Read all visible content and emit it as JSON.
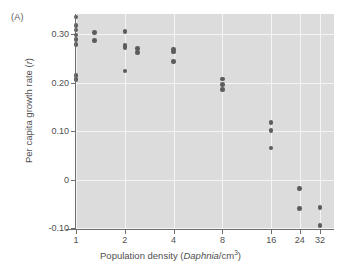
{
  "panel": {
    "label": "(A)"
  },
  "chart_data": {
    "type": "scatter",
    "title": "",
    "xlabel_parts": {
      "pre": "Population density (",
      "italic": "Daphnia",
      "post": "/cm",
      "sup": "3",
      "end": ")"
    },
    "xlabel": "Population density (Daphnia/cm3)",
    "ylabel_parts": {
      "pre": "Per capita growth rate (",
      "italic": "r",
      "post": ")"
    },
    "ylabel": "Per capita growth rate (r)",
    "x_scale": "log",
    "x_ticks": [
      1,
      2,
      4,
      8,
      16,
      24,
      32
    ],
    "x_tick_labels": [
      "1",
      "2",
      "4",
      "8",
      "16",
      "24",
      "32"
    ],
    "y_ticks": [
      0.3,
      0.2,
      0.1,
      0,
      -0.1
    ],
    "y_tick_labels": [
      "0.30",
      "0.20",
      "0.10",
      "0",
      "-0.10"
    ],
    "ylim": [
      -0.105,
      0.345
    ],
    "grid": true,
    "grid_color": "#f4f4f4",
    "plot_background": "#dcdcdc",
    "point_color": "#5c5c5c",
    "legend": null,
    "points": [
      {
        "x": 1,
        "y": 0.335
      },
      {
        "x": 1,
        "y": 0.317
      },
      {
        "x": 1,
        "y": 0.308
      },
      {
        "x": 1,
        "y": 0.298
      },
      {
        "x": 1,
        "y": 0.289
      },
      {
        "x": 1,
        "y": 0.278
      },
      {
        "x": 1,
        "y": 0.214
      },
      {
        "x": 1,
        "y": 0.206
      },
      {
        "x": 1.3,
        "y": 0.303
      },
      {
        "x": 1.3,
        "y": 0.287
      },
      {
        "x": 2,
        "y": 0.305
      },
      {
        "x": 2,
        "y": 0.276
      },
      {
        "x": 2,
        "y": 0.272
      },
      {
        "x": 2,
        "y": 0.224
      },
      {
        "x": 2.4,
        "y": 0.27
      },
      {
        "x": 2.4,
        "y": 0.262
      },
      {
        "x": 4,
        "y": 0.268
      },
      {
        "x": 4,
        "y": 0.263
      },
      {
        "x": 4,
        "y": 0.243
      },
      {
        "x": 8,
        "y": 0.207
      },
      {
        "x": 8,
        "y": 0.196
      },
      {
        "x": 8,
        "y": 0.186
      },
      {
        "x": 16,
        "y": 0.118
      },
      {
        "x": 16,
        "y": 0.101
      },
      {
        "x": 16,
        "y": 0.065
      },
      {
        "x": 24,
        "y": -0.018
      },
      {
        "x": 24,
        "y": -0.06
      },
      {
        "x": 32,
        "y": -0.058
      },
      {
        "x": 32,
        "y": -0.095
      }
    ]
  }
}
